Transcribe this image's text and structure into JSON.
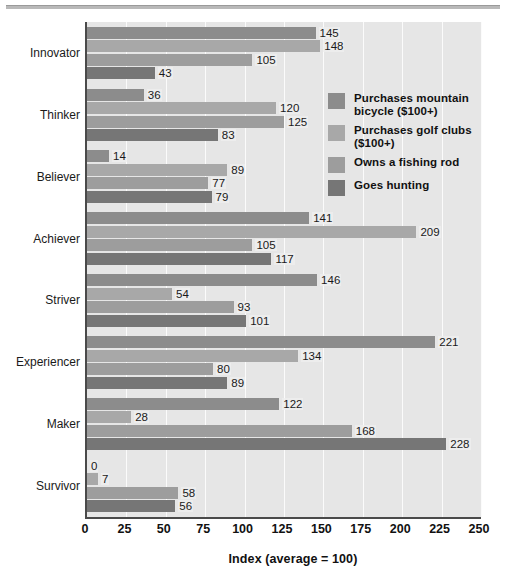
{
  "chart_data": {
    "type": "bar",
    "orientation": "horizontal-grouped",
    "title": "",
    "xlabel": "Index (average = 100)",
    "ylabel": "",
    "xlim": [
      0,
      250
    ],
    "xticks": [
      0,
      25,
      50,
      75,
      100,
      125,
      150,
      175,
      200,
      225,
      250
    ],
    "grid": true,
    "legend_position": "inside-right-upper",
    "categories": [
      "Innovator",
      "Thinker",
      "Believer",
      "Achiever",
      "Striver",
      "Experiencer",
      "Maker",
      "Survivor"
    ],
    "series": [
      {
        "name": "Purchases mountain bicycle ($100+)",
        "color": "#8c8c8c",
        "values": [
          145,
          36,
          14,
          141,
          146,
          221,
          122,
          0
        ]
      },
      {
        "name": "Purchases golf clubs ($100+)",
        "color": "#a8a8a8",
        "values": [
          148,
          120,
          89,
          209,
          54,
          134,
          28,
          7
        ]
      },
      {
        "name": "Owns a fishing rod",
        "color": "#9d9d9d",
        "values": [
          105,
          125,
          77,
          105,
          93,
          80,
          168,
          58
        ]
      },
      {
        "name": "Goes hunting",
        "color": "#767676",
        "values": [
          43,
          83,
          79,
          117,
          101,
          89,
          228,
          56
        ]
      }
    ]
  },
  "legend": {
    "items": [
      {
        "label": "Purchases mountain bicycle ($100+)",
        "swatch_name": "legend-swatch-mountain-bicycle"
      },
      {
        "label": "Purchases golf clubs ($100+)",
        "swatch_name": "legend-swatch-golf-clubs"
      },
      {
        "label": "Owns a fishing rod",
        "swatch_name": "legend-swatch-fishing-rod"
      },
      {
        "label": "Goes hunting",
        "swatch_name": "legend-swatch-goes-hunting"
      }
    ]
  },
  "colors": {
    "plot_background": "#e6e6e6",
    "gridline": "#fbfbfb",
    "axis": "#4a4a4a",
    "text": "#111111",
    "top_rule": "#b9b9b9"
  }
}
